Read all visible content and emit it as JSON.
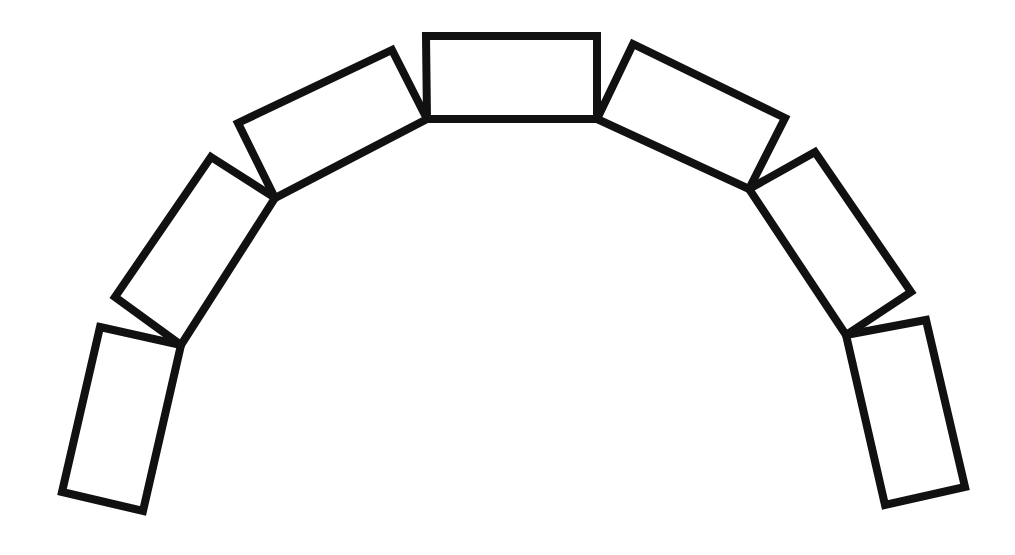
{
  "diagram": {
    "type": "arch-of-rectangles",
    "background": "#ffffff",
    "stroke_color": "#111111",
    "stroke_width": 8,
    "blocks": [
      {
        "id": "block-1",
        "points": "100,327 181,345 143,511 62,492"
      },
      {
        "id": "block-2",
        "points": "211,157 275,198 181,345 115,297"
      },
      {
        "id": "block-3",
        "points": "238,123 392,50 427,119 275,198"
      },
      {
        "id": "block-4",
        "points": "426,36 597,36 597,119 427,119"
      },
      {
        "id": "block-5",
        "points": "633,44 785,118 749,189 597,119"
      },
      {
        "id": "block-6",
        "points": "749,189 815,152 911,292 846,335"
      },
      {
        "id": "block-7",
        "points": "846,335 926,320 965,487 885,505"
      }
    ]
  }
}
